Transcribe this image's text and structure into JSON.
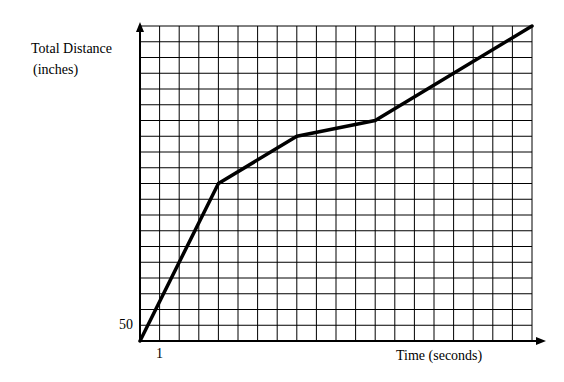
{
  "chart_data": {
    "type": "line",
    "title": "",
    "xlabel": "Time (seconds)",
    "ylabel": "Total Distance (inches)",
    "ylabel_lines": [
      "Total Distance",
      "(inches)"
    ],
    "x_tick_label": "1",
    "y_tick_label": "50",
    "x_unit_per_grid": 1,
    "y_unit_per_grid": 50,
    "xlim": [
      0,
      20
    ],
    "ylim": [
      0,
      1000
    ],
    "grid": true,
    "grid_columns": 20,
    "grid_rows": 20,
    "series": [
      {
        "name": "Total Distance",
        "x": [
          0,
          4,
          8,
          12,
          20
        ],
        "y": [
          0,
          500,
          650,
          700,
          1000
        ]
      }
    ],
    "colors": {
      "line": "#000000",
      "grid": "#000000",
      "background": "#ffffff"
    }
  }
}
